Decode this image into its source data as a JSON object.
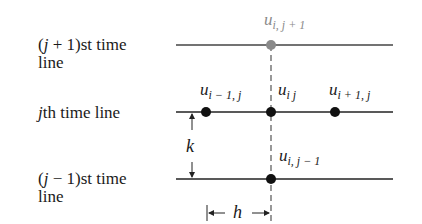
{
  "diagram": {
    "rows": [
      {
        "id": "j_plus_1",
        "label_line1_prefix": "(",
        "label_var": "j",
        "label_line1_suffix": " + 1)st time",
        "label_line2": "line",
        "y": 45
      },
      {
        "id": "j",
        "label_var": "j",
        "label_line1_suffix": "th time line",
        "y": 112
      },
      {
        "id": "j_minus_1",
        "label_line1_prefix": "(",
        "label_var": "j",
        "label_line1_suffix": " − 1)st time",
        "label_line2": "line",
        "y": 179
      }
    ],
    "nodes": [
      {
        "id": "u_i_jp1",
        "base": "u",
        "sub": "i, j + 1",
        "x": 271,
        "y": 45,
        "color": "#8a8a8a"
      },
      {
        "id": "u_im1_j",
        "base": "u",
        "sub": "i − 1, j",
        "x": 206,
        "y": 112,
        "color": "#111111"
      },
      {
        "id": "u_ij",
        "base": "u",
        "sub": "i j",
        "x": 271,
        "y": 112,
        "color": "#111111"
      },
      {
        "id": "u_ip1_j",
        "base": "u",
        "sub": "i + 1, j",
        "x": 335,
        "y": 112,
        "color": "#111111"
      },
      {
        "id": "u_i_jm1",
        "base": "u",
        "sub": "i, j − 1",
        "x": 271,
        "y": 179,
        "color": "#111111"
      }
    ],
    "dimensions": {
      "k_label": "k",
      "h_label": "h"
    },
    "colors": {
      "line": "#333333",
      "dashed": "#555555",
      "gray_node": "#8a8a8a"
    }
  }
}
